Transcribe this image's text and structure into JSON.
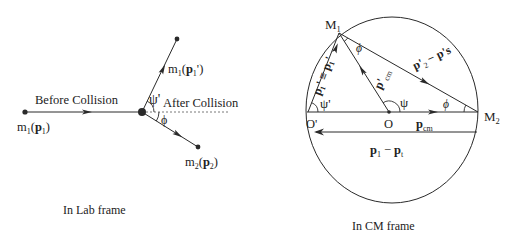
{
  "lab_frame": {
    "caption": "In Lab frame",
    "before_label": "Before Collision",
    "after_label": "After Collision",
    "incoming_particle": {
      "mass": "m",
      "mass_sub": "1",
      "momentum": "p",
      "momentum_sub": "1",
      "text": "m1(p1)"
    },
    "scattered_particle": {
      "mass": "m",
      "mass_sub": "1",
      "momentum": "p",
      "momentum_sub": "1",
      "prime": "'",
      "text": "m1(p1')"
    },
    "recoil_particle": {
      "mass": "m",
      "mass_sub": "2",
      "momentum": "p",
      "momentum_sub": "2",
      "text": "m2(p2)"
    },
    "angle_scatter": "ψ'",
    "angle_recoil": "ϕ"
  },
  "cm_frame": {
    "caption": "In CM frame",
    "points": {
      "M1": {
        "base": "M",
        "sub": "1"
      },
      "M2": {
        "base": "M",
        "sub": "2"
      },
      "O_prime": "O'",
      "O": "O"
    },
    "vectors": {
      "p1_prime": "p₁' ≡ p₁'",
      "p_cm_prime": {
        "base": "p'",
        "sub": "cm"
      },
      "p2_minus": {
        "base": "p'",
        "sub": "2",
        "rest": "− p's"
      },
      "p_cm": {
        "base": "p",
        "sub": "cm"
      },
      "p1_minus_pt": {
        "a": "p",
        "a_sub": "1",
        "op": "−",
        "b": "p",
        "b_sub": "t"
      }
    },
    "angles": {
      "psi_prime": "ψ'",
      "psi": "ψ",
      "phi_top": "ϕ",
      "phi_right": "ϕ"
    }
  },
  "colors": {
    "line": "#2a2a2a",
    "text": "#222222",
    "background": "#ffffff"
  }
}
